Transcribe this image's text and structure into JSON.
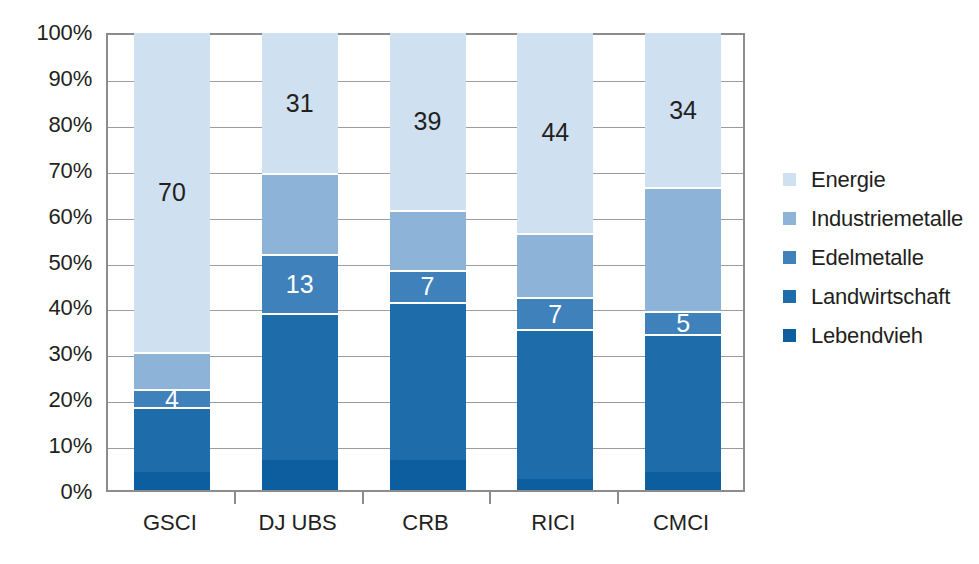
{
  "chart_data": {
    "type": "bar",
    "subtype": "stacked-100-percent",
    "title": "",
    "xlabel": "",
    "ylabel": "",
    "ylim": [
      0,
      100
    ],
    "y_unit": "%",
    "grid": true,
    "legend_position": "right",
    "categories": [
      "GSCI",
      "DJ UBS",
      "CRB",
      "RICI",
      "CMCI"
    ],
    "ytick_labels": [
      "0%",
      "10%",
      "20%",
      "30%",
      "40%",
      "50%",
      "60%",
      "70%",
      "80%",
      "90%",
      "100%"
    ],
    "ytick_values": [
      0,
      10,
      20,
      30,
      40,
      50,
      60,
      70,
      80,
      90,
      100
    ],
    "series": [
      {
        "name": "Energie",
        "color": "#cfe0f0",
        "values": [
          70,
          31,
          39,
          44,
          34
        ],
        "labels": [
          "70",
          "31",
          "39",
          "44",
          "34"
        ],
        "label_color": "dark"
      },
      {
        "name": "Industriemetalle",
        "color": "#8db3d8",
        "values": [
          8,
          17.5,
          13,
          14,
          27
        ],
        "labels": [
          "",
          "",
          "",
          "",
          ""
        ],
        "label_color": "dark"
      },
      {
        "name": "Edelmetalle",
        "color": "#3f81bb",
        "values": [
          4,
          13,
          7,
          7,
          5
        ],
        "labels": [
          "4",
          "13",
          "7",
          "7",
          "5"
        ],
        "label_color": "light"
      },
      {
        "name": "Landwirtschaft",
        "color": "#1f6cab",
        "values": [
          14,
          32,
          34.5,
          32.5,
          30
        ],
        "labels": [
          "",
          "",
          "",
          "",
          ""
        ],
        "label_color": "light"
      },
      {
        "name": "Lebendvieh",
        "color": "#0d5e9e",
        "values": [
          4,
          6.5,
          6.5,
          2.5,
          4
        ],
        "labels": [
          "",
          "",
          "",
          "",
          ""
        ],
        "label_color": "light"
      }
    ]
  },
  "legend": {
    "items": [
      {
        "label": "Energie",
        "color": "#cfe0f0"
      },
      {
        "label": "Industriemetalle",
        "color": "#8db3d8"
      },
      {
        "label": "Edelmetalle",
        "color": "#3f81bb"
      },
      {
        "label": "Landwirtschaft",
        "color": "#1f6cab"
      },
      {
        "label": "Lebendvieh",
        "color": "#0d5e9e"
      }
    ]
  }
}
